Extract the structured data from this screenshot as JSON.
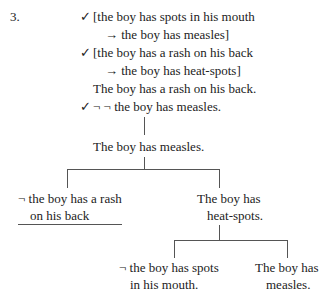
{
  "item_number": "3.",
  "premises": [
    {
      "check": "✓",
      "text": "[the boy has spots in his mouth"
    },
    {
      "check": "",
      "text": "→ the boy has measles]"
    },
    {
      "check": "✓",
      "text": "[the boy has a rash on his back"
    },
    {
      "check": "",
      "text": "→ the boy has heat-spots]"
    },
    {
      "check": "",
      "text": "The boy has a rash on his back."
    },
    {
      "check": "✓",
      "text": "¬ ¬ the boy has measles."
    }
  ],
  "tree": {
    "node1": "The boy has measles.",
    "left_branch": {
      "line1": "¬ the boy has a rash",
      "line2": "on his back",
      "closed": true
    },
    "right_branch": {
      "line1": "The boy has",
      "line2": "heat-spots."
    },
    "sub_left": {
      "line1": "¬ the boy has spots",
      "line2": "in his mouth."
    },
    "sub_right": {
      "line1": "The boy has",
      "line2": "measles."
    }
  }
}
